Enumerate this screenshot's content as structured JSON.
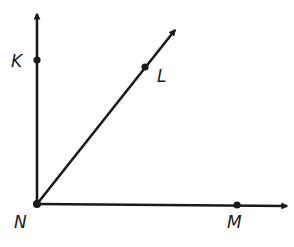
{
  "diagram": {
    "type": "geometry-rays",
    "stroke_color": "#1a1a1a",
    "vertex": {
      "label": "N",
      "x": 37,
      "y": 204,
      "label_x": 14,
      "label_y": 228
    },
    "rays": [
      {
        "id": "NK",
        "point": {
          "label": "K",
          "x": 37,
          "y": 60,
          "label_x": 11,
          "label_y": 67
        },
        "end": {
          "x": 37,
          "y": 14
        }
      },
      {
        "id": "NL",
        "point": {
          "label": "L",
          "x": 145,
          "y": 67,
          "label_x": 157,
          "label_y": 82
        },
        "end": {
          "x": 175,
          "y": 30
        }
      },
      {
        "id": "NM",
        "point": {
          "label": "M",
          "x": 237,
          "y": 205,
          "label_x": 227,
          "label_y": 228
        },
        "end": {
          "x": 287,
          "y": 206
        }
      }
    ]
  }
}
